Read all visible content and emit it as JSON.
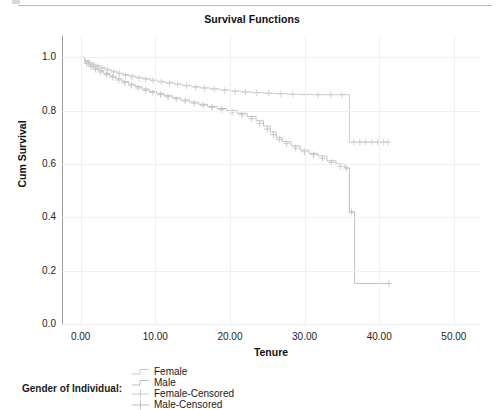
{
  "chart_title": "Survival Functions",
  "legend": {
    "title": "Gender of Individual:",
    "entries": [
      {
        "label": "Female",
        "marker": "step-line",
        "color": "#c9c9c9"
      },
      {
        "label": "Male",
        "marker": "step-line",
        "color": "#bdbdbd"
      },
      {
        "label": "Female-Censored",
        "marker": "plus-cross",
        "color": "#c9c9c9"
      },
      {
        "label": "Male-Censored",
        "marker": "plus-cross",
        "color": "#bdbdbd"
      }
    ]
  },
  "chart_data": {
    "type": "line",
    "title": "Survival Functions",
    "subtitle": "",
    "xlabel": "Tenure",
    "ylabel": "Cum Survival",
    "xlim": [
      -2.5,
      53.5
    ],
    "ylim": [
      0.0,
      1.08
    ],
    "grid": true,
    "legend_position": "bottom",
    "xticks": [
      "0.00",
      "10.00",
      "20.00",
      "30.00",
      "40.00",
      "50.00"
    ],
    "xtick_values": [
      0,
      10,
      20,
      30,
      40,
      50
    ],
    "yticks": [
      "0.0",
      "0.2",
      "0.4",
      "0.6",
      "0.8",
      "1.0"
    ],
    "ytick_values": [
      0.0,
      0.2,
      0.4,
      0.6,
      0.8,
      1.0
    ],
    "series": [
      {
        "name": "Female",
        "type": "step",
        "color": "#cdcdcd",
        "points": [
          [
            0.0,
            1.0
          ],
          [
            0.6,
            0.988
          ],
          [
            1.2,
            0.978
          ],
          [
            1.9,
            0.97
          ],
          [
            2.6,
            0.962
          ],
          [
            3.3,
            0.955
          ],
          [
            4.1,
            0.948
          ],
          [
            4.9,
            0.941
          ],
          [
            5.7,
            0.935
          ],
          [
            6.5,
            0.93
          ],
          [
            7.4,
            0.925
          ],
          [
            8.3,
            0.92
          ],
          [
            9.3,
            0.915
          ],
          [
            10.3,
            0.91
          ],
          [
            11.4,
            0.905
          ],
          [
            12.5,
            0.9
          ],
          [
            13.6,
            0.895
          ],
          [
            14.8,
            0.89
          ],
          [
            16.0,
            0.886
          ],
          [
            17.3,
            0.882
          ],
          [
            18.6,
            0.878
          ],
          [
            20.0,
            0.874
          ],
          [
            21.4,
            0.871
          ],
          [
            22.9,
            0.868
          ],
          [
            24.4,
            0.866
          ],
          [
            26.0,
            0.864
          ],
          [
            27.6,
            0.862
          ],
          [
            29.3,
            0.861
          ],
          [
            31.0,
            0.86
          ],
          [
            33.0,
            0.86
          ],
          [
            35.2,
            0.86
          ],
          [
            35.9,
            0.86
          ],
          [
            36.0,
            0.682
          ],
          [
            41.2,
            0.682
          ]
        ],
        "censored": [
          [
            1.0,
            0.98
          ],
          [
            1.6,
            0.973
          ],
          [
            2.2,
            0.966
          ],
          [
            2.9,
            0.959
          ],
          [
            3.6,
            0.952
          ],
          [
            4.4,
            0.945
          ],
          [
            5.2,
            0.938
          ],
          [
            6.0,
            0.932
          ],
          [
            6.9,
            0.927
          ],
          [
            7.8,
            0.922
          ],
          [
            8.7,
            0.918
          ],
          [
            9.7,
            0.913
          ],
          [
            10.8,
            0.908
          ],
          [
            11.9,
            0.903
          ],
          [
            13.0,
            0.898
          ],
          [
            14.2,
            0.893
          ],
          [
            15.4,
            0.888
          ],
          [
            16.6,
            0.884
          ],
          [
            17.9,
            0.88
          ],
          [
            19.3,
            0.876
          ],
          [
            20.7,
            0.872
          ],
          [
            22.1,
            0.869
          ],
          [
            23.6,
            0.867
          ],
          [
            25.2,
            0.865
          ],
          [
            26.8,
            0.863
          ],
          [
            28.4,
            0.861
          ],
          [
            30.1,
            0.86
          ],
          [
            31.8,
            0.86
          ],
          [
            33.5,
            0.86
          ],
          [
            35.0,
            0.86
          ],
          [
            36.6,
            0.682
          ],
          [
            37.4,
            0.682
          ],
          [
            38.2,
            0.682
          ],
          [
            39.0,
            0.682
          ],
          [
            39.8,
            0.682
          ],
          [
            40.6,
            0.682
          ],
          [
            41.2,
            0.682
          ]
        ]
      },
      {
        "name": "Male",
        "type": "step",
        "color": "#c2c2c2",
        "points": [
          [
            0.0,
            1.0
          ],
          [
            0.5,
            0.985
          ],
          [
            1.1,
            0.972
          ],
          [
            1.7,
            0.96
          ],
          [
            2.4,
            0.95
          ],
          [
            3.1,
            0.94
          ],
          [
            3.9,
            0.93
          ],
          [
            4.7,
            0.92
          ],
          [
            5.5,
            0.91
          ],
          [
            6.4,
            0.9
          ],
          [
            7.3,
            0.89
          ],
          [
            8.2,
            0.881
          ],
          [
            9.2,
            0.872
          ],
          [
            10.2,
            0.864
          ],
          [
            11.2,
            0.856
          ],
          [
            12.3,
            0.848
          ],
          [
            13.4,
            0.84
          ],
          [
            14.6,
            0.832
          ],
          [
            15.8,
            0.824
          ],
          [
            17.0,
            0.816
          ],
          [
            18.3,
            0.808
          ],
          [
            19.6,
            0.8
          ],
          [
            21.0,
            0.79
          ],
          [
            22.3,
            0.778
          ],
          [
            23.5,
            0.762
          ],
          [
            24.5,
            0.742
          ],
          [
            25.4,
            0.72
          ],
          [
            26.2,
            0.7
          ],
          [
            27.0,
            0.684
          ],
          [
            28.2,
            0.668
          ],
          [
            29.4,
            0.652
          ],
          [
            30.6,
            0.64
          ],
          [
            31.8,
            0.63
          ],
          [
            33.0,
            0.612
          ],
          [
            34.2,
            0.6
          ],
          [
            35.4,
            0.585
          ],
          [
            35.9,
            0.585
          ],
          [
            36.0,
            0.42
          ],
          [
            36.6,
            0.42
          ],
          [
            36.7,
            0.152
          ],
          [
            41.3,
            0.152
          ]
        ],
        "censored": [
          [
            0.8,
            0.978
          ],
          [
            1.4,
            0.966
          ],
          [
            2.0,
            0.955
          ],
          [
            2.7,
            0.945
          ],
          [
            3.5,
            0.935
          ],
          [
            4.3,
            0.925
          ],
          [
            5.1,
            0.915
          ],
          [
            5.9,
            0.905
          ],
          [
            6.8,
            0.895
          ],
          [
            7.7,
            0.885
          ],
          [
            8.7,
            0.876
          ],
          [
            9.7,
            0.868
          ],
          [
            10.7,
            0.86
          ],
          [
            11.7,
            0.852
          ],
          [
            12.8,
            0.844
          ],
          [
            14.0,
            0.836
          ],
          [
            15.2,
            0.828
          ],
          [
            16.4,
            0.82
          ],
          [
            17.6,
            0.812
          ],
          [
            18.9,
            0.804
          ],
          [
            20.3,
            0.795
          ],
          [
            21.6,
            0.784
          ],
          [
            22.9,
            0.77
          ],
          [
            24.0,
            0.752
          ],
          [
            25.0,
            0.731
          ],
          [
            25.8,
            0.71
          ],
          [
            26.6,
            0.692
          ],
          [
            27.6,
            0.676
          ],
          [
            28.8,
            0.66
          ],
          [
            30.0,
            0.646
          ],
          [
            31.2,
            0.635
          ],
          [
            32.4,
            0.621
          ],
          [
            33.6,
            0.606
          ],
          [
            34.8,
            0.592
          ],
          [
            35.6,
            0.585
          ],
          [
            36.3,
            0.42
          ],
          [
            41.3,
            0.152
          ]
        ]
      }
    ],
    "annotations": []
  }
}
